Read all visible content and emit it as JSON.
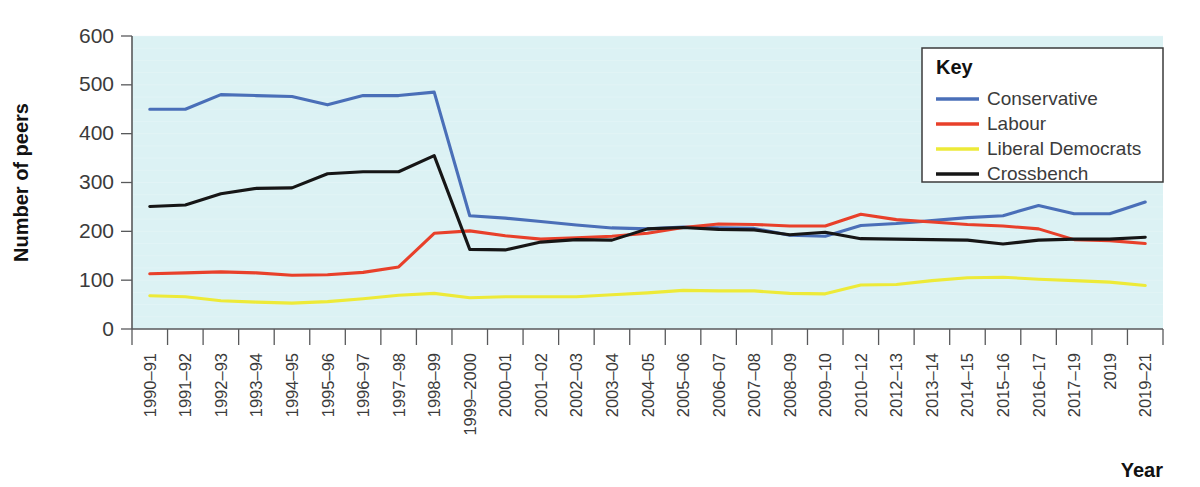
{
  "chart_data": {
    "type": "line",
    "title": "",
    "xlabel": "Year",
    "ylabel": "Number of peers",
    "ylim": [
      0,
      600
    ],
    "ytick_step": 100,
    "yticks": [
      0,
      100,
      200,
      300,
      400,
      500,
      600
    ],
    "grid": false,
    "legend_position": "top-right",
    "legend_title": "Key",
    "plot_background": "#dcf2f4",
    "categories": [
      "1990–91",
      "1991–92",
      "1992–93",
      "1993–94",
      "1994–95",
      "1995–96",
      "1996–97",
      "1997–98",
      "1998–99",
      "1999–2000",
      "2000–01",
      "2001–02",
      "2002–03",
      "2003–04",
      "2004–05",
      "2005–06",
      "2006–07",
      "2007–08",
      "2008–09",
      "2009–10",
      "2010–12",
      "2012–13",
      "2013–14",
      "2014–15",
      "2015–16",
      "2016–17",
      "2017–19",
      "2019",
      "2019–21"
    ],
    "series": [
      {
        "name": "Conservative",
        "color": "#4a6fb8",
        "values": [
          450,
          450,
          480,
          478,
          476,
          459,
          478,
          478,
          485,
          232,
          227,
          220,
          213,
          207,
          205,
          209,
          207,
          206,
          192,
          190,
          212,
          216,
          222,
          228,
          232,
          253,
          236,
          236,
          260
        ]
      },
      {
        "name": "Labour",
        "color": "#e8402a",
        "values": [
          113,
          115,
          117,
          115,
          110,
          111,
          116,
          127,
          196,
          201,
          191,
          184,
          187,
          190,
          196,
          208,
          215,
          214,
          211,
          211,
          235,
          224,
          219,
          214,
          211,
          205,
          183,
          181,
          175
        ]
      },
      {
        "name": "Liberal Democrats",
        "color": "#edea38",
        "values": [
          68,
          66,
          58,
          55,
          53,
          56,
          62,
          69,
          73,
          64,
          66,
          66,
          66,
          70,
          74,
          79,
          78,
          78,
          73,
          72,
          90,
          91,
          99,
          105,
          106,
          102,
          99,
          96,
          89
        ]
      },
      {
        "name": "Crossbench",
        "color": "#161616",
        "values": [
          251,
          254,
          277,
          288,
          289,
          318,
          322,
          322,
          355,
          163,
          162,
          178,
          183,
          182,
          205,
          208,
          204,
          203,
          193,
          198,
          185,
          184,
          183,
          182,
          174,
          182,
          184,
          184,
          188
        ]
      }
    ]
  },
  "axes": {
    "y_title": "Number of peers",
    "x_title": "Year"
  }
}
